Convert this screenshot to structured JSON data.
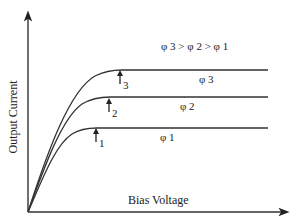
{
  "chart_data": {
    "type": "line",
    "title": "",
    "xlabel": "Bias Voltage",
    "ylabel": "Output Current",
    "relation_label": "φ 3 > φ 2 > φ 1",
    "grid": false,
    "ticks": false,
    "series": [
      {
        "name": "φ 3",
        "subscript": "3",
        "saturation_marker": "3",
        "description": "rises steeply from origin then saturates at the highest current level"
      },
      {
        "name": "φ 2",
        "subscript": "2",
        "saturation_marker": "2",
        "description": "rises from origin then saturates at the middle current level"
      },
      {
        "name": "φ 1",
        "subscript": "1",
        "saturation_marker": "1",
        "description": "rises from origin then saturates at the lowest current level"
      }
    ],
    "annotations": [
      "↑3",
      "↑2",
      "↑1"
    ]
  },
  "labels": {
    "relation": "φ 3 > φ 2 > φ 1",
    "phi3": "φ 3",
    "phi2": "φ 2",
    "phi1": "φ 1",
    "marker3": "3",
    "marker2": "2",
    "marker1": "1",
    "xlabel": "Bias Voltage",
    "ylabel": "Output Current"
  }
}
